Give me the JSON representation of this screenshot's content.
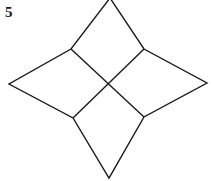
{
  "figure": {
    "label": "5",
    "stroke_color": "#1a1a1a",
    "background": "#ffffff",
    "shape": "four-pointed star divided into four quadrilaterals",
    "vertices": {
      "top": [
        110,
        -2
      ],
      "upper_left": [
        71,
        49
      ],
      "upper_right": [
        144,
        49
      ],
      "left": [
        9,
        84
      ],
      "right": [
        207,
        83
      ],
      "center": [
        108,
        84
      ],
      "lower_left": [
        73,
        118
      ],
      "lower_right": [
        144,
        117
      ],
      "bottom": [
        109,
        178
      ]
    }
  }
}
